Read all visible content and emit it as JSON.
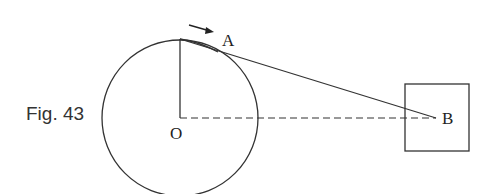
{
  "figure": {
    "caption": "Fig. 43",
    "labels": {
      "point_a": "A",
      "point_b": "B",
      "center_o": "O"
    },
    "elements": [
      "circle centered at O",
      "radius from O to top of circle",
      "string from top of circle through A to B",
      "dashed line from O to B",
      "square block around B",
      "arrow indicating direction of motion near A"
    ],
    "colors": {
      "stroke": "#333333",
      "background": "#ffffff"
    }
  }
}
